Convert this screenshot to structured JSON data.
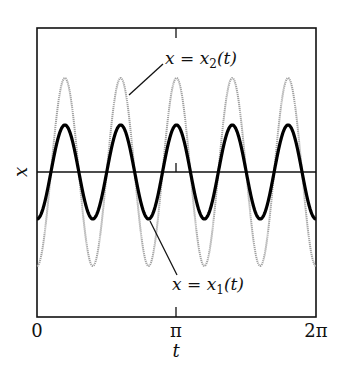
{
  "chart_data": {
    "type": "line",
    "title": "",
    "xlabel": "t",
    "ylabel": "x",
    "xlim": [
      0,
      6.2832
    ],
    "ylim": [
      -1.6,
      1.6
    ],
    "grid": false,
    "xticks": [
      {
        "value": 0,
        "label": "0"
      },
      {
        "value": 3.1416,
        "label": "π"
      },
      {
        "value": 6.2832,
        "label": "2π"
      }
    ],
    "series": [
      {
        "name": "x = x₁(t)",
        "style": "thick black",
        "color": "#000000",
        "formula": "x1(t) = -0.5·cos(5t)",
        "amplitude": 0.5,
        "angular_frequency": 5,
        "cycles_in_range": 5
      },
      {
        "name": "x = x₂(t)",
        "style": "thin gray dotted",
        "color": "#9a9a9a",
        "formula": "x2(t) = -1.0·cos(5t)",
        "amplitude": 1.0,
        "angular_frequency": 5,
        "cycles_in_range": 5
      }
    ],
    "annotations": [
      {
        "text": "x = x₂(t)",
        "points_to": "x2 curve, second cycle"
      },
      {
        "text": "x = x₁(t)",
        "points_to": "x1 curve, third trough"
      }
    ],
    "reference_lines": [
      {
        "type": "horizontal",
        "y": 0
      }
    ]
  },
  "labels": {
    "ylabel": "x",
    "xlabel": "t",
    "tick0": "0",
    "tickpi": "π",
    "tick2pi": "2π",
    "x2_var": "x = x",
    "x2_sub": "2",
    "x2_arg": "(t)",
    "x1_var": "x = x",
    "x1_sub": "1",
    "x1_arg": "(t)"
  }
}
